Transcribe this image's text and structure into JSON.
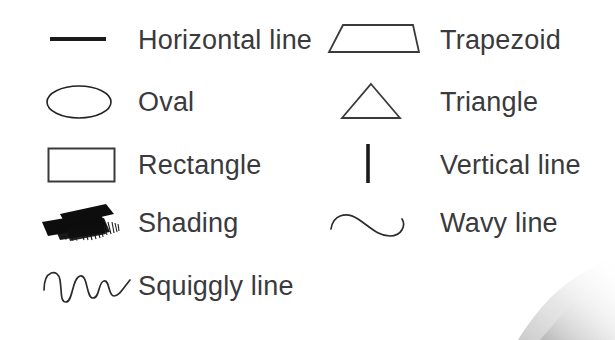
{
  "page": {
    "background_color": "#ffffff",
    "ink_color": "#3a3a3c"
  },
  "legend": {
    "left_column": [
      {
        "icon": "horizontal-line-icon",
        "label": "Horizontal line"
      },
      {
        "icon": "oval-icon",
        "label": "Oval"
      },
      {
        "icon": "rectangle-icon",
        "label": "Rectangle"
      },
      {
        "icon": "shading-brush-icon",
        "label": "Shading"
      },
      {
        "icon": "squiggly-line-icon",
        "label": "Squiggly line"
      }
    ],
    "right_column": [
      {
        "icon": "trapezoid-icon",
        "label": "Trapezoid"
      },
      {
        "icon": "triangle-icon",
        "label": "Triangle"
      },
      {
        "icon": "vertical-line-icon",
        "label": "Vertical line"
      },
      {
        "icon": "wavy-line-icon",
        "label": "Wavy line"
      }
    ]
  },
  "decoration": {
    "page_curl": "page-curl-shadow"
  }
}
